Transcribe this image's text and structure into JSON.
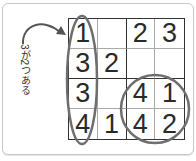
{
  "annotation": {
    "label": "3が2つある",
    "arrow": "curved-arrow-icon"
  },
  "grid": {
    "size": 4,
    "cells": [
      [
        "1",
        "",
        "2",
        "3"
      ],
      [
        "3",
        "2",
        "",
        ""
      ],
      [
        "3",
        "",
        "4",
        "1"
      ],
      [
        "4",
        "1",
        "4",
        "2"
      ]
    ]
  },
  "highlights": [
    {
      "type": "ellipse",
      "target": "column 1"
    },
    {
      "type": "circle",
      "target": "bottom-right 2x2 box"
    }
  ],
  "colors": {
    "highlight": "#6e6e6e",
    "grid_line": "#333333",
    "text": "#2a2a2a"
  }
}
